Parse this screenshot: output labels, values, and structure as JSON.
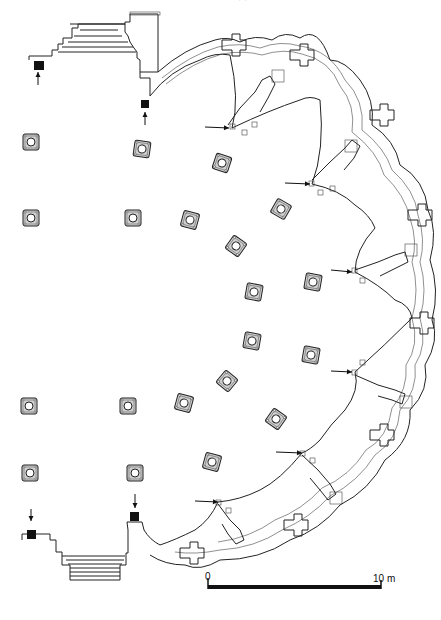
{
  "figure": {
    "type": "architectural floor plan",
    "header_fragment": "· ·"
  },
  "scale_bar": {
    "start_label": "0",
    "end_label": "10 m",
    "x_start": 208,
    "x_end": 381,
    "y": 587
  },
  "colors": {
    "ink": "#222222",
    "background": "#ffffff",
    "pier_fill": "#cfcfcf",
    "solid_fill": "#111111"
  },
  "piers": [
    {
      "x": 31,
      "y": 142,
      "rot": 0
    },
    {
      "x": 142,
      "y": 149,
      "rot": 8
    },
    {
      "x": 222,
      "y": 163,
      "rot": 18
    },
    {
      "x": 31,
      "y": 218,
      "rot": 0
    },
    {
      "x": 133,
      "y": 218,
      "rot": 0
    },
    {
      "x": 190,
      "y": 220,
      "rot": 15
    },
    {
      "x": 281,
      "y": 209,
      "rot": 30
    },
    {
      "x": 236,
      "y": 246,
      "rot": 35
    },
    {
      "x": 254,
      "y": 292,
      "rot": 10
    },
    {
      "x": 313,
      "y": 282,
      "rot": 10
    },
    {
      "x": 252,
      "y": 341,
      "rot": 10
    },
    {
      "x": 311,
      "y": 355,
      "rot": 10
    },
    {
      "x": 227,
      "y": 381,
      "rot": 40
    },
    {
      "x": 29,
      "y": 406,
      "rot": 0
    },
    {
      "x": 128,
      "y": 406,
      "rot": 0
    },
    {
      "x": 184,
      "y": 403,
      "rot": 15
    },
    {
      "x": 276,
      "y": 419,
      "rot": 35
    },
    {
      "x": 212,
      "y": 462,
      "rot": 15
    },
    {
      "x": 30,
      "y": 473,
      "rot": 0
    },
    {
      "x": 135,
      "y": 473,
      "rot": 0
    }
  ],
  "arrows": [
    {
      "x1": 38,
      "y1": 85,
      "x2": 38,
      "y2": 72,
      "dir": "up"
    },
    {
      "x1": 145,
      "y1": 125,
      "x2": 145,
      "y2": 112,
      "dir": "up"
    },
    {
      "x1": 205,
      "y1": 127,
      "x2": 229,
      "y2": 128,
      "dir": "right"
    },
    {
      "x1": 285,
      "y1": 183,
      "x2": 310,
      "y2": 184,
      "dir": "right"
    },
    {
      "x1": 331,
      "y1": 270,
      "x2": 352,
      "y2": 272,
      "dir": "right"
    },
    {
      "x1": 331,
      "y1": 371,
      "x2": 352,
      "y2": 372,
      "dir": "right"
    },
    {
      "x1": 276,
      "y1": 452,
      "x2": 302,
      "y2": 453,
      "dir": "right"
    },
    {
      "x1": 195,
      "y1": 501,
      "x2": 218,
      "y2": 502,
      "dir": "right"
    },
    {
      "x1": 31,
      "y1": 509,
      "x2": 31,
      "y2": 521,
      "dir": "down"
    },
    {
      "x1": 135,
      "y1": 494,
      "x2": 135,
      "y2": 508,
      "dir": "down"
    }
  ],
  "solid_blocks": [
    {
      "x": 34,
      "y": 61,
      "w": 10,
      "h": 9
    },
    {
      "x": 141,
      "y": 100,
      "w": 8,
      "h": 8
    },
    {
      "x": 27,
      "y": 530,
      "w": 9,
      "h": 9
    },
    {
      "x": 130,
      "y": 512,
      "w": 9,
      "h": 9
    }
  ]
}
